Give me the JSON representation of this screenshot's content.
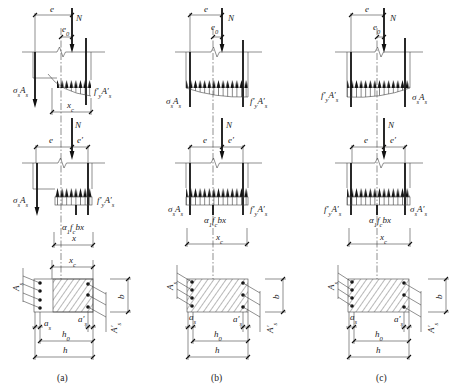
{
  "colors": {
    "line": "#444444",
    "steel": "#111111",
    "background": "#ffffff"
  },
  "panels": [
    {
      "caption": "(a)",
      "row1": {
        "e": "e",
        "N": "N",
        "e0": [
          [
            "e",
            "n"
          ],
          [
            "0",
            "s"
          ]
        ],
        "left_force": [
          [
            "σ",
            "n"
          ],
          [
            "s",
            "s"
          ],
          [
            "A",
            "n"
          ],
          [
            "s",
            "s"
          ]
        ],
        "right_force": [
          [
            "f′",
            "n"
          ],
          [
            "y",
            "s"
          ],
          [
            "A′",
            "n"
          ],
          [
            "s",
            "s"
          ]
        ],
        "xc": [
          [
            "x",
            "n"
          ],
          [
            "c",
            "s"
          ]
        ]
      },
      "row2": {
        "N": "N",
        "e": "e",
        "e_prime": "e′",
        "left_force": [
          [
            "σ",
            "n"
          ],
          [
            "s",
            "s"
          ],
          [
            "A",
            "n"
          ],
          [
            "s",
            "s"
          ]
        ],
        "right_force": [
          [
            "f′",
            "n"
          ],
          [
            "y",
            "s"
          ],
          [
            "A′",
            "n"
          ],
          [
            "s",
            "s"
          ]
        ],
        "concrete_resultant": [
          [
            "α",
            "n"
          ],
          [
            "1",
            "s"
          ],
          [
            "f",
            "n"
          ],
          [
            "c",
            "s"
          ],
          [
            "bx",
            "n"
          ]
        ],
        "depth": [
          [
            "x",
            "n"
          ]
        ]
      },
      "row3": {
        "xc": [
          [
            "x",
            "n"
          ],
          [
            "c",
            "s"
          ]
        ],
        "As": [
          [
            "A",
            "n"
          ],
          [
            "s",
            "s"
          ]
        ],
        "As_prime": [
          [
            "A′",
            "n"
          ],
          [
            "s",
            "s"
          ]
        ],
        "b": "b",
        "as": [
          [
            "a",
            "n"
          ],
          [
            "s",
            "s"
          ]
        ],
        "as_prime": [
          [
            "a′",
            "n"
          ],
          [
            "s",
            "s"
          ]
        ],
        "h0": [
          [
            "h",
            "n"
          ],
          [
            "0",
            "s"
          ]
        ],
        "h": "h"
      }
    },
    {
      "caption": "(b)",
      "row1": {
        "e": "e",
        "N": "N",
        "e0": [
          [
            "e",
            "n"
          ],
          [
            "0",
            "s"
          ]
        ],
        "left_force": [
          [
            "σ",
            "n"
          ],
          [
            "s",
            "s"
          ],
          [
            "A",
            "n"
          ],
          [
            "s",
            "s"
          ]
        ],
        "right_force": [
          [
            "f′",
            "n"
          ],
          [
            "y",
            "s"
          ],
          [
            "A′",
            "n"
          ],
          [
            "s",
            "s"
          ]
        ]
      },
      "row2": {
        "N": "N",
        "e": "e",
        "e_prime": "e′",
        "left_force": [
          [
            "σ",
            "n"
          ],
          [
            "s",
            "s"
          ],
          [
            "A",
            "n"
          ],
          [
            "s",
            "s"
          ]
        ],
        "right_force": [
          [
            "f′",
            "n"
          ],
          [
            "y",
            "s"
          ],
          [
            "A′",
            "n"
          ],
          [
            "s",
            "s"
          ]
        ],
        "concrete_resultant": [
          [
            "α",
            "n"
          ],
          [
            "1",
            "s"
          ],
          [
            "f",
            "n"
          ],
          [
            "c",
            "s"
          ],
          [
            "bx",
            "n"
          ]
        ],
        "depth": [
          [
            "x",
            "n"
          ],
          [
            "c",
            "s"
          ]
        ]
      },
      "row3": {
        "As": [
          [
            "A",
            "n"
          ],
          [
            "s",
            "s"
          ]
        ],
        "As_prime": [
          [
            "A′",
            "n"
          ],
          [
            "s",
            "s"
          ]
        ],
        "b": "b",
        "as": [
          [
            "a",
            "n"
          ],
          [
            "s",
            "s"
          ]
        ],
        "as_prime": [
          [
            "a′",
            "n"
          ],
          [
            "s",
            "s"
          ]
        ],
        "h0": [
          [
            "h",
            "n"
          ],
          [
            "0",
            "s"
          ]
        ],
        "h": "h"
      }
    },
    {
      "caption": "(c)",
      "row1": {
        "e": "e",
        "N": "N",
        "e0": [
          [
            "e",
            "n"
          ],
          [
            "0",
            "s"
          ]
        ],
        "left_force": [
          [
            "f′",
            "n"
          ],
          [
            "y",
            "s"
          ],
          [
            "A′",
            "n"
          ],
          [
            "s",
            "s"
          ]
        ],
        "right_force": [
          [
            "σ",
            "n"
          ],
          [
            "s",
            "s"
          ],
          [
            "A",
            "n"
          ],
          [
            "s",
            "s"
          ]
        ]
      },
      "row2": {
        "N": "N",
        "e": "e",
        "e_prime": "e′",
        "left_force": [
          [
            "f′",
            "n"
          ],
          [
            "y",
            "s"
          ],
          [
            "A′",
            "n"
          ],
          [
            "s",
            "s"
          ]
        ],
        "right_force": [
          [
            "σ",
            "n"
          ],
          [
            "s",
            "s"
          ],
          [
            "A′",
            "n"
          ],
          [
            "s",
            "s"
          ]
        ],
        "concrete_resultant": [
          [
            "α",
            "n"
          ],
          [
            "1",
            "s"
          ],
          [
            "f",
            "n"
          ],
          [
            "c",
            "s"
          ],
          [
            "bx",
            "n"
          ]
        ],
        "depth": [
          [
            "x",
            "n"
          ],
          [
            "c",
            "s"
          ]
        ]
      },
      "row3": {
        "As": [
          [
            "A",
            "n"
          ],
          [
            "s",
            "s"
          ]
        ],
        "As_prime": [
          [
            "A′",
            "n"
          ],
          [
            "s",
            "s"
          ]
        ],
        "b": "b",
        "as": [
          [
            "a",
            "n"
          ],
          [
            "s",
            "s"
          ]
        ],
        "as_prime": [
          [
            "a′",
            "n"
          ],
          [
            "s",
            "s"
          ]
        ],
        "h0": [
          [
            "h",
            "n"
          ],
          [
            "0",
            "s"
          ]
        ],
        "h": "h"
      }
    }
  ]
}
